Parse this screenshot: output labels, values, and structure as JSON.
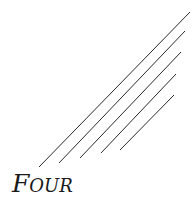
{
  "title": "Four",
  "lines": [
    {
      "x1": 39,
      "y1": 167,
      "x2": 190,
      "y2": 12
    },
    {
      "x1": 59,
      "y1": 163,
      "x2": 185,
      "y2": 31
    },
    {
      "x1": 80,
      "y1": 158,
      "x2": 181,
      "y2": 52
    },
    {
      "x1": 101,
      "y1": 153,
      "x2": 176,
      "y2": 74
    },
    {
      "x1": 120,
      "y1": 150,
      "x2": 174,
      "y2": 95
    }
  ],
  "colors": {
    "line": "#2a2a2a",
    "text": "#1a1a1a",
    "background": "#ffffff"
  }
}
